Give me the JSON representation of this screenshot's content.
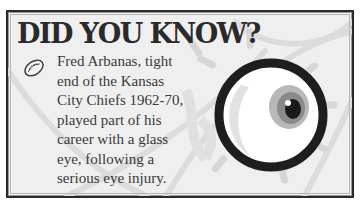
{
  "card": {
    "title": "DID YOU KNOW?",
    "fact_lines": [
      "Fred Arbanas, tight",
      "end of the Kansas",
      "City Chiefs 1962-70,",
      "played part of his",
      "career with a glass",
      "eye, following a",
      "serious eye injury."
    ],
    "icons": {
      "bullet": "football-icon",
      "illustration": "eyeball-icon"
    },
    "colors": {
      "border": "#2a2a2a",
      "background": "#efefef",
      "text": "#3a3a3a",
      "iris": "#8a8a8a",
      "eye_ring": "#1e1e1e"
    }
  }
}
